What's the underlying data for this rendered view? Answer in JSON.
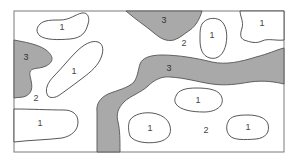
{
  "diagram": {
    "type": "zone-map",
    "colors": {
      "background": "#ffffff",
      "zone_3_fill": "#a9a9a9",
      "zone_1_fill": "#ffffff",
      "outline": "#444444",
      "frame": "#7a7a7a"
    },
    "labels": {
      "top_left_1": "1",
      "left_3": "3",
      "left_diag_1": "1",
      "left_2": "2",
      "bottom_left_1": "1",
      "top_center_3": "3",
      "center_2": "2",
      "oval_1": "1",
      "top_right_1": "1",
      "band_3": "3",
      "mid_bottom_1": "1",
      "bottom_center_left_1": "1",
      "bottom_2": "2",
      "bottom_right_1": "1"
    }
  }
}
